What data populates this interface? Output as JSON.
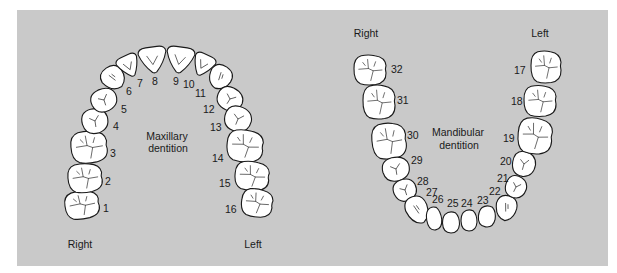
{
  "colors": {
    "background": "#ffffff",
    "panel": "#c9c9c9",
    "tooth_fill": "#ffffff",
    "tooth_outline": "#1a1a1a",
    "text": "#1a1a1a"
  },
  "maxillary": {
    "caption_line1": "Maxillary",
    "caption_line2": "dentition",
    "side_right": "Right",
    "side_left": "Left",
    "teeth": [
      {
        "num": "1",
        "cx": 82,
        "cy": 205,
        "w": 34,
        "h": 28,
        "rot": -8,
        "type": "molar",
        "lx": 103,
        "ly": 212
      },
      {
        "num": "2",
        "cx": 85,
        "cy": 178,
        "w": 34,
        "h": 29,
        "rot": -5,
        "type": "molar",
        "lx": 105,
        "ly": 185
      },
      {
        "num": "3",
        "cx": 89,
        "cy": 147,
        "w": 36,
        "h": 32,
        "rot": -5,
        "type": "molar",
        "lx": 110,
        "ly": 157
      },
      {
        "num": "4",
        "cx": 95,
        "cy": 121,
        "w": 26,
        "h": 25,
        "rot": -15,
        "type": "premolar",
        "lx": 113,
        "ly": 130
      },
      {
        "num": "5",
        "cx": 104,
        "cy": 100,
        "w": 26,
        "h": 23,
        "rot": -25,
        "type": "premolar",
        "lx": 121,
        "ly": 113
      },
      {
        "num": "6",
        "cx": 113,
        "cy": 78,
        "w": 23,
        "h": 24,
        "rot": -35,
        "type": "canine",
        "lx": 126,
        "ly": 95
      },
      {
        "num": "7",
        "cx": 129,
        "cy": 66,
        "w": 22,
        "h": 22,
        "rot": -25,
        "type": "incisor",
        "lx": 137,
        "ly": 87
      },
      {
        "num": "8",
        "cx": 153,
        "cy": 60,
        "w": 28,
        "h": 26,
        "rot": -8,
        "type": "incisor",
        "lx": 152,
        "ly": 85
      },
      {
        "num": "9",
        "cx": 180,
        "cy": 60,
        "w": 28,
        "h": 26,
        "rot": 8,
        "type": "incisor",
        "lx": 173,
        "ly": 85
      },
      {
        "num": "10",
        "cx": 203,
        "cy": 65,
        "w": 22,
        "h": 22,
        "rot": 25,
        "type": "incisor",
        "lx": 183,
        "ly": 88
      },
      {
        "num": "11",
        "cx": 220,
        "cy": 77,
        "w": 23,
        "h": 24,
        "rot": 35,
        "type": "canine",
        "lx": 195,
        "ly": 97
      },
      {
        "num": "12",
        "cx": 230,
        "cy": 99,
        "w": 26,
        "h": 23,
        "rot": 25,
        "type": "premolar",
        "lx": 203,
        "ly": 113
      },
      {
        "num": "13",
        "cx": 238,
        "cy": 119,
        "w": 27,
        "h": 25,
        "rot": 15,
        "type": "premolar",
        "lx": 210,
        "ly": 131
      },
      {
        "num": "14",
        "cx": 245,
        "cy": 146,
        "w": 36,
        "h": 32,
        "rot": 5,
        "type": "molar",
        "lx": 212,
        "ly": 162
      },
      {
        "num": "15",
        "cx": 252,
        "cy": 176,
        "w": 34,
        "h": 29,
        "rot": 5,
        "type": "molar",
        "lx": 219,
        "ly": 187
      },
      {
        "num": "16",
        "cx": 257,
        "cy": 203,
        "w": 31,
        "h": 28,
        "rot": 8,
        "type": "molar",
        "lx": 225,
        "ly": 213
      }
    ]
  },
  "mandibular": {
    "caption_line1": "Mandibular",
    "caption_line2": "dentition",
    "side_right": "Right",
    "side_left": "Left",
    "teeth": [
      {
        "num": "32",
        "cx": 370,
        "cy": 70,
        "w": 32,
        "h": 30,
        "rot": 0,
        "type": "molar",
        "lx": 391,
        "ly": 73
      },
      {
        "num": "31",
        "cx": 379,
        "cy": 102,
        "w": 32,
        "h": 34,
        "rot": 0,
        "type": "molar",
        "lx": 397,
        "ly": 104
      },
      {
        "num": "30",
        "cx": 389,
        "cy": 141,
        "w": 34,
        "h": 36,
        "rot": -5,
        "type": "molar",
        "lx": 407,
        "ly": 139
      },
      {
        "num": "29",
        "cx": 396,
        "cy": 169,
        "w": 27,
        "h": 24,
        "rot": -15,
        "type": "premolar",
        "lx": 411,
        "ly": 164
      },
      {
        "num": "28",
        "cx": 405,
        "cy": 190,
        "w": 23,
        "h": 22,
        "rot": -25,
        "type": "premolar",
        "lx": 417,
        "ly": 185
      },
      {
        "num": "27",
        "cx": 417,
        "cy": 210,
        "w": 22,
        "h": 28,
        "rot": -20,
        "type": "canine",
        "lx": 426,
        "ly": 196
      },
      {
        "num": "26",
        "cx": 434,
        "cy": 218,
        "w": 15,
        "h": 24,
        "rot": -8,
        "type": "lower-incisor",
        "lx": 432,
        "ly": 203
      },
      {
        "num": "25",
        "cx": 451,
        "cy": 222,
        "w": 17,
        "h": 22,
        "rot": 0,
        "type": "lower-incisor",
        "lx": 447,
        "ly": 207
      },
      {
        "num": "24",
        "cx": 469,
        "cy": 220,
        "w": 16,
        "h": 22,
        "rot": 0,
        "type": "lower-incisor",
        "lx": 461,
        "ly": 207
      },
      {
        "num": "23",
        "cx": 487,
        "cy": 216,
        "w": 17,
        "h": 22,
        "rot": 8,
        "type": "lower-incisor",
        "lx": 477,
        "ly": 204
      },
      {
        "num": "22",
        "cx": 506,
        "cy": 208,
        "w": 21,
        "h": 25,
        "rot": 15,
        "type": "canine",
        "lx": 489,
        "ly": 195
      },
      {
        "num": "21",
        "cx": 516,
        "cy": 187,
        "w": 21,
        "h": 22,
        "rot": 20,
        "type": "premolar",
        "lx": 497,
        "ly": 182
      },
      {
        "num": "20",
        "cx": 524,
        "cy": 164,
        "w": 23,
        "h": 25,
        "rot": 10,
        "type": "premolar",
        "lx": 500,
        "ly": 165
      },
      {
        "num": "19",
        "cx": 535,
        "cy": 136,
        "w": 34,
        "h": 36,
        "rot": 5,
        "type": "molar",
        "lx": 503,
        "ly": 142
      },
      {
        "num": "18",
        "cx": 540,
        "cy": 101,
        "w": 32,
        "h": 31,
        "rot": 0,
        "type": "molar",
        "lx": 511,
        "ly": 105
      },
      {
        "num": "17",
        "cx": 546,
        "cy": 67,
        "w": 30,
        "h": 32,
        "rot": 0,
        "type": "molar",
        "lx": 514,
        "ly": 74
      }
    ]
  }
}
